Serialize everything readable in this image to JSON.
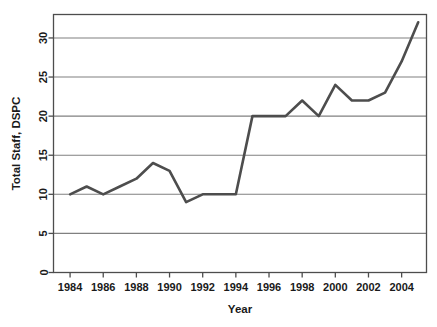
{
  "chart_data": {
    "type": "line",
    "title": "",
    "xlabel": "Year",
    "ylabel": "Total Staff, DSPC",
    "x": [
      1984,
      1985,
      1986,
      1987,
      1988,
      1989,
      1990,
      1991,
      1992,
      1993,
      1994,
      1995,
      1996,
      1997,
      1998,
      1999,
      2000,
      2001,
      2002,
      2003,
      2004,
      2005
    ],
    "values": [
      10,
      11,
      10,
      11,
      12,
      14,
      13,
      9,
      10,
      10,
      10,
      20,
      20,
      20,
      22,
      20,
      24,
      22,
      22,
      23,
      27,
      32
    ],
    "series": [
      {
        "name": "Total Staff, DSPC",
        "values": [
          10,
          11,
          10,
          11,
          12,
          14,
          13,
          9,
          10,
          10,
          10,
          20,
          20,
          20,
          22,
          20,
          24,
          22,
          22,
          23,
          27,
          32
        ]
      }
    ],
    "xlim": [
      1983,
      2005.5
    ],
    "ylim": [
      0,
      33
    ],
    "xticks": [
      1984,
      1986,
      1988,
      1990,
      1992,
      1994,
      1996,
      1998,
      2000,
      2002,
      2004
    ],
    "xtick_labels": [
      "1984",
      "1986",
      "1988",
      "1990",
      "1992",
      "1994",
      "1996",
      "1998",
      "2000",
      "2002",
      "2004"
    ],
    "yticks": [
      0,
      5,
      10,
      15,
      20,
      25,
      30
    ],
    "ytick_labels": [
      "0",
      "5",
      "10",
      "15",
      "20",
      "25",
      "30"
    ],
    "grid": "horizontal",
    "legend": "none",
    "line_color": "#4d4d4d",
    "grid_color": "#808080",
    "axis_color": "#4d4d4d",
    "background_color": "#ffffff"
  }
}
